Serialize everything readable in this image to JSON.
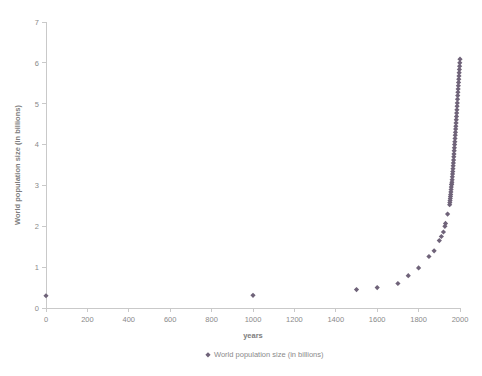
{
  "chart_data": {
    "type": "scatter",
    "title": "",
    "xlabel": "years",
    "ylabel": "World population size (in billions)",
    "xlim": [
      0,
      2000
    ],
    "ylim": [
      0,
      7
    ],
    "xticks": [
      0,
      200,
      400,
      600,
      800,
      1000,
      1200,
      1400,
      1600,
      1800,
      2000
    ],
    "yticks": [
      0,
      1,
      2,
      3,
      4,
      5,
      6,
      7
    ],
    "grid": false,
    "legend_position": "bottom",
    "legend": [
      "World population size (in billions)"
    ],
    "marker": "diamond",
    "marker_color": "#6f6379",
    "series": [
      {
        "name": "World population size (in billions)",
        "x": [
          0,
          1000,
          1500,
          1600,
          1700,
          1750,
          1800,
          1850,
          1875,
          1900,
          1910,
          1920,
          1927,
          1930,
          1940,
          1950,
          1951,
          1952,
          1953,
          1954,
          1955,
          1956,
          1957,
          1958,
          1959,
          1960,
          1961,
          1962,
          1963,
          1964,
          1965,
          1966,
          1967,
          1968,
          1969,
          1970,
          1971,
          1972,
          1973,
          1974,
          1975,
          1976,
          1977,
          1978,
          1979,
          1980,
          1981,
          1982,
          1983,
          1984,
          1985,
          1986,
          1987,
          1988,
          1989,
          1990,
          1991,
          1992,
          1993,
          1994,
          1995,
          1996,
          1997,
          1998,
          1999,
          2000
        ],
        "y": [
          0.3,
          0.31,
          0.45,
          0.5,
          0.6,
          0.79,
          0.98,
          1.26,
          1.4,
          1.65,
          1.75,
          1.86,
          2.0,
          2.07,
          2.3,
          2.53,
          2.58,
          2.63,
          2.68,
          2.73,
          2.78,
          2.84,
          2.9,
          2.96,
          3.02,
          3.03,
          3.08,
          3.14,
          3.21,
          3.28,
          3.34,
          3.41,
          3.48,
          3.55,
          3.62,
          3.7,
          3.77,
          3.85,
          3.92,
          4.0,
          4.07,
          4.15,
          4.23,
          4.3,
          4.38,
          4.45,
          4.53,
          4.61,
          4.69,
          4.77,
          4.85,
          4.94,
          5.02,
          5.11,
          5.2,
          5.28,
          5.36,
          5.44,
          5.52,
          5.6,
          5.68,
          5.76,
          5.84,
          5.92,
          6.0,
          6.09
        ]
      }
    ]
  },
  "chart": {
    "plot": {
      "left": 46,
      "right": 460,
      "top": 22,
      "bottom": 308
    }
  }
}
